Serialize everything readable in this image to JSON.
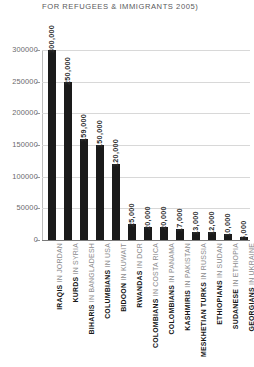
{
  "chart_data": {
    "type": "bar",
    "title": "FOR REFUGEES & IMMIGRANTS 2005)",
    "xlabel": "",
    "ylabel": "",
    "ylim": [
      0,
      325000
    ],
    "grid": true,
    "legend": "none",
    "orientation": "vertical",
    "bar_color": "#1a1a1a",
    "gridline_color": "#d8d8d8",
    "categories": [
      "IRAQIS IN JORDAN",
      "KURDS IN SYRIA",
      "BIHARIS IN BANGLADESH",
      "COLUMBIANS IN USA",
      "BIDOON IN KUWAIT",
      "RWANDAS IN DCR",
      "COLOMBIANS IN COSTA RICA",
      "COLOMBIANS IN PANAMA",
      "KASHMIRIS IN PAKISTAN",
      "MESKHETIAN TURKS IN RUSSIA",
      "ETHIOPIANS IN SUDAN",
      "SUDANESE IN ETHIOPIA",
      "GEORGIANS IN UKRAINE"
    ],
    "category_parts": [
      {
        "group": "IRAQIS",
        "location": "IN JORDAN"
      },
      {
        "group": "KURDS",
        "location": "IN SYRIA"
      },
      {
        "group": "BIHARIS",
        "location": "IN BANGLADESH"
      },
      {
        "group": "COLUMBIANS",
        "location": "IN USA"
      },
      {
        "group": "BIDOON",
        "location": "IN KUWAIT"
      },
      {
        "group": "RWANDAS",
        "location": "IN DCR"
      },
      {
        "group": "COLOMBIANS",
        "location": "IN COSTA RICA"
      },
      {
        "group": "COLOMBIANS",
        "location": "IN PANAMA"
      },
      {
        "group": "KASHMIRIS",
        "location": "IN PAKISTAN"
      },
      {
        "group": "MESKHETIAN TURKS",
        "location": "IN RUSSIA"
      },
      {
        "group": "ETHIOPIANS",
        "location": "IN SUDAN"
      },
      {
        "group": "SUDANESE",
        "location": "IN ETHIOPIA"
      },
      {
        "group": "GEORGIANS",
        "location": "IN UKRAINE"
      }
    ],
    "values": [
      300000,
      250000,
      159000,
      150000,
      120000,
      25000,
      20000,
      20000,
      17000,
      13000,
      12000,
      10000,
      5000
    ],
    "data_labels": [
      "300,000",
      "250,000",
      "159,000",
      "150,000",
      "120,000",
      "25,000",
      "20,000",
      "20,000",
      "17,000",
      "13,000",
      "12,000",
      "10,000",
      "5,000"
    ],
    "yticks": [
      0,
      50000,
      100000,
      150000,
      200000,
      250000,
      300000
    ],
    "ytick_labels": [
      "0",
      "50000",
      "100000",
      "150000",
      "200000",
      "250000",
      "300000"
    ]
  }
}
